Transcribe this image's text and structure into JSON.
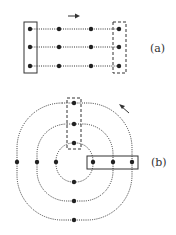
{
  "figure": {
    "panel_a": {
      "label": "(a)",
      "description": "3x4 grid of nodes connected by dotted horizontal lines; solid box around first column, dashed box around last column; arrow pointing right",
      "rows_y": [
        29,
        47,
        66
      ],
      "cols_x": [
        30,
        59,
        91,
        119
      ],
      "arrow_direction": "right"
    },
    "panel_b": {
      "label": "(b)",
      "description": "three concentric dotted rounded loops with nodes on axes; dashed box around top vertical column of nodes, solid box around right horizontal row of nodes; arrow pointing counter-clockwise (up-left)",
      "arrow_direction": "counter-clockwise"
    },
    "colors": {
      "ink": "#333333",
      "background": "#ffffff"
    }
  }
}
